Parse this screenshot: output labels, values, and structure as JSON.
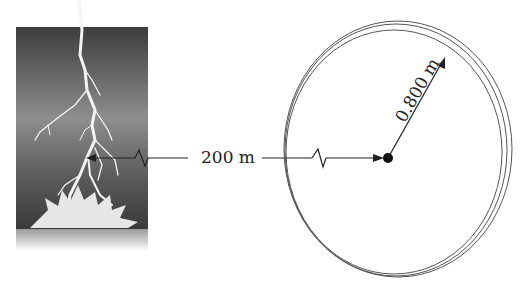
{
  "diagram": {
    "distance_label": "200 m",
    "radius_label": "0.800 m",
    "lightning": {
      "description": "lightning bolt striking ground"
    },
    "loop": {
      "description": "circular wire loop with center point"
    },
    "colors": {
      "line": "#222222",
      "sky_top": "#4a4a4a",
      "sky_mid": "#8a8a8a",
      "loop": "#555555"
    }
  }
}
